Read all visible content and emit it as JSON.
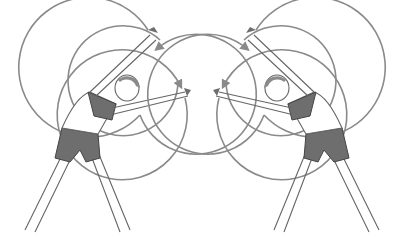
{
  "image": {
    "description": "Two mirrored line illustrations of a woman doing standing side-bend stretches with circular motion arrows",
    "figures": [
      {
        "side": "left",
        "bend_direction": "right"
      },
      {
        "side": "right",
        "bend_direction": "left"
      }
    ],
    "colors": {
      "line": "#8a8a8a",
      "clothing": "#6e6e6e",
      "outline": "#555555",
      "background": "#ffffff"
    }
  }
}
